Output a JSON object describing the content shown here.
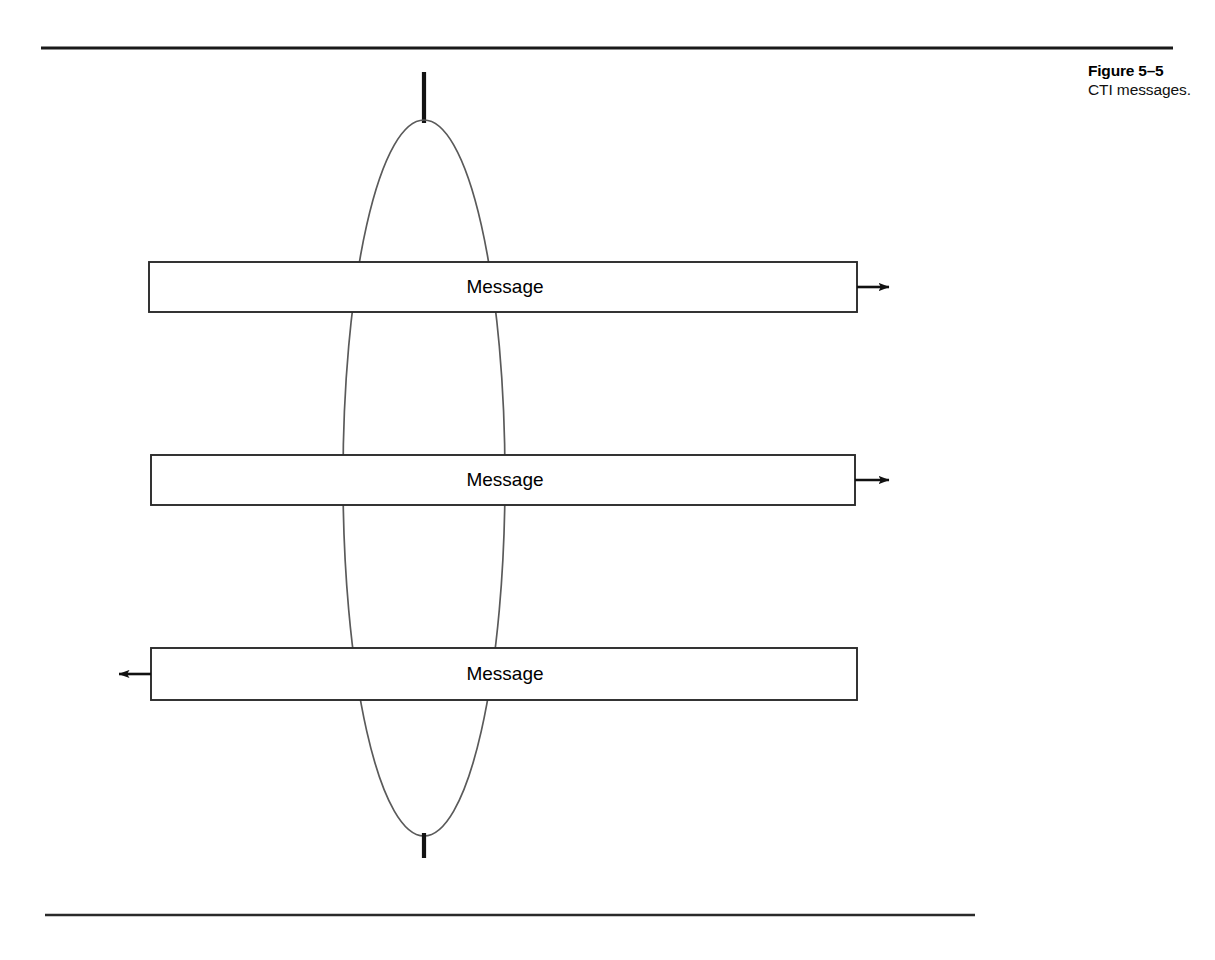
{
  "figure": {
    "caption_title": "Figure 5–5",
    "caption_text": "CTI messages."
  },
  "diagram": {
    "type": "sequence-like-message-diagram",
    "colors": {
      "stroke": "#1a1a1a",
      "ellipse_stroke": "#555555",
      "background": "#ffffff",
      "text": "#000000"
    },
    "rules": [
      {
        "name": "top-rule",
        "x1": 41,
        "y": 48,
        "x2": 1173,
        "thickness": 3
      },
      {
        "name": "bottom-rule",
        "x1": 45,
        "y": 915,
        "x2": 975,
        "thickness": 3
      }
    ],
    "lifeline": {
      "x": 424,
      "top_segment": {
        "y1": 72,
        "y2": 122
      },
      "bottom_segment": {
        "y1": 834,
        "y2": 858
      },
      "thickness": 4
    },
    "ellipse": {
      "cx": 424,
      "cy": 478,
      "rx": 81,
      "ry": 358,
      "left_x": 343,
      "right_x": 505,
      "top_y": 120,
      "bottom_y": 836
    },
    "messages": [
      {
        "label": "Message",
        "x": 149,
        "y": 262,
        "width": 708,
        "height": 50,
        "label_cx": 505,
        "arrow_direction": "right",
        "arrow_from": 857,
        "arrow_to": 893
      },
      {
        "label": "Message",
        "x": 151,
        "y": 455,
        "width": 704,
        "height": 50,
        "label_cx": 505,
        "arrow_direction": "right",
        "arrow_from": 855,
        "arrow_to": 893
      },
      {
        "label": "Message",
        "x": 151,
        "y": 648,
        "width": 706,
        "height": 52,
        "label_cx": 505,
        "arrow_direction": "left",
        "arrow_from": 151,
        "arrow_to": 115
      }
    ]
  }
}
